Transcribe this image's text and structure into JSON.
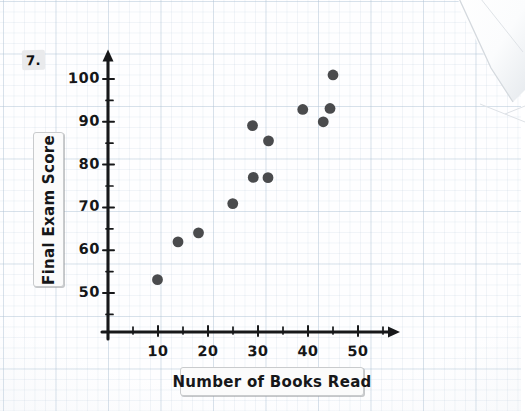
{
  "worksheet": {
    "question_number": "7."
  },
  "chart_data": {
    "type": "scatter",
    "title": "",
    "xlabel": "Number of Books Read",
    "ylabel": "Final Exam Score",
    "xlim": [
      0,
      58
    ],
    "ylim": [
      43,
      105
    ],
    "x_ticks": [
      10,
      20,
      30,
      40,
      50
    ],
    "x_tick_labels": [
      "10",
      "20",
      "30",
      "40",
      "50"
    ],
    "x_minor_ticks": [
      5,
      15,
      25,
      35,
      45,
      55
    ],
    "y_ticks": [
      50,
      60,
      70,
      80,
      90,
      100
    ],
    "y_tick_labels": [
      "50",
      "60",
      "70",
      "80",
      "90",
      "100"
    ],
    "y_minor_ticks": [
      45,
      55,
      65,
      75,
      85,
      95
    ],
    "grid": true,
    "legend": false,
    "marker_color": "#4a4b4d",
    "axis_color": "#17181a",
    "points": [
      {
        "x": 10,
        "y": 53
      },
      {
        "x": 14,
        "y": 62
      },
      {
        "x": 18,
        "y": 64
      },
      {
        "x": 25,
        "y": 71
      },
      {
        "x": 29,
        "y": 77
      },
      {
        "x": 29,
        "y": 89
      },
      {
        "x": 32,
        "y": 77
      },
      {
        "x": 32,
        "y": 85.5
      },
      {
        "x": 39,
        "y": 93
      },
      {
        "x": 43,
        "y": 90
      },
      {
        "x": 44.5,
        "y": 93
      },
      {
        "x": 45,
        "y": 101
      }
    ]
  }
}
